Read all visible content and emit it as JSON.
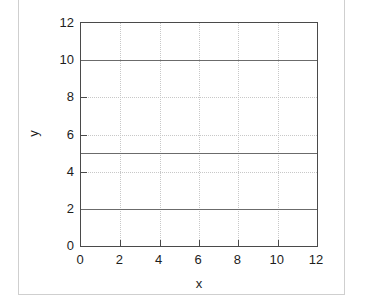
{
  "chart_data": {
    "type": "line",
    "title": "",
    "subtitle": "",
    "xlabel": "x",
    "ylabel": "y",
    "xlim": [
      0,
      12
    ],
    "ylim": [
      0,
      12
    ],
    "xticks": [
      0,
      2,
      4,
      6,
      8,
      10,
      12
    ],
    "yticks": [
      0,
      2,
      4,
      6,
      8,
      10,
      12
    ],
    "xtick_labels": [
      "0",
      "2",
      "4",
      "6",
      "8",
      "10",
      "12"
    ],
    "ytick_labels": [
      "0",
      "2",
      "4",
      "6",
      "8",
      "10",
      "12"
    ],
    "grid": true,
    "grid_style": "dotted",
    "legend": "none",
    "x": [
      0,
      12
    ],
    "series": [
      {
        "name": "y = 10",
        "values": [
          10,
          10
        ],
        "color": "#6b6b6b"
      },
      {
        "name": "y = 5",
        "values": [
          5,
          5
        ],
        "color": "#6b6b6b"
      },
      {
        "name": "y = 2",
        "values": [
          2,
          2
        ],
        "color": "#6b6b6b"
      }
    ],
    "colors": {
      "axis": "#4a4a4a",
      "grid": "#c8c8c8",
      "series": "#6b6b6b",
      "text": "#1d1d1d",
      "background": "#ffffff",
      "outer_frame": "#cfcfcf"
    }
  }
}
